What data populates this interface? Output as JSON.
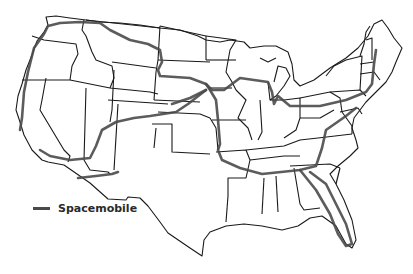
{
  "map": {
    "title_fragment": "",
    "region": "United States (contiguous)",
    "colors": {
      "state_outline": "#1a1a1a",
      "route": "#4a4a4a",
      "background": "#ffffff"
    }
  },
  "legend": {
    "items": [
      {
        "label": "Spacemobile",
        "color": "#4a4a4a",
        "symbol": "line"
      }
    ]
  }
}
